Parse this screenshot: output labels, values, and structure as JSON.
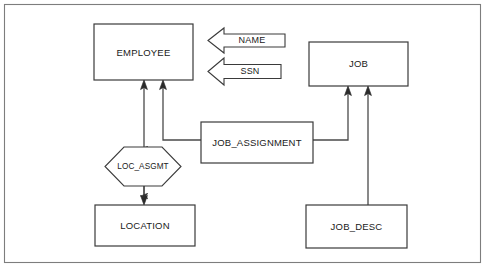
{
  "diagram": {
    "canvas": {
      "width": 487,
      "height": 272,
      "background": "#ffffff"
    },
    "frame": {
      "x": 4,
      "y": 4,
      "width": 477,
      "height": 259,
      "stroke": "#7d7d7d"
    },
    "stroke_color": "#3a3a3a",
    "line_color": "#4a4a4a",
    "fill_color": "#ffffff",
    "text_color": "#1a1a1a",
    "entities": [
      {
        "id": "employee",
        "label": "EMPLOYEE",
        "shape": "rectangle",
        "x": 94,
        "y": 24,
        "width": 99,
        "height": 56
      },
      {
        "id": "job",
        "label": "JOB",
        "shape": "rectangle",
        "x": 309,
        "y": 42,
        "width": 99,
        "height": 44
      },
      {
        "id": "job_assignment",
        "label": "JOB_ASSIGNMENT",
        "shape": "rectangle",
        "x": 201,
        "y": 122,
        "width": 112,
        "height": 41
      },
      {
        "id": "location",
        "label": "LOCATION",
        "shape": "rectangle",
        "x": 95,
        "y": 205,
        "width": 100,
        "height": 41
      },
      {
        "id": "job_desc",
        "label": "JOB_DESC",
        "shape": "rectangle",
        "x": 306,
        "y": 205,
        "width": 101,
        "height": 43
      }
    ],
    "relationships": [
      {
        "id": "loc_asgmt",
        "label": "LOC_ASGMT",
        "shape": "hexagon",
        "x": 105,
        "y": 147,
        "width": 76,
        "height": 39
      }
    ],
    "attributes": [
      {
        "id": "name",
        "label": "NAME",
        "shape": "left-arrow",
        "x": 208,
        "y": 28,
        "width": 77,
        "height": 25
      },
      {
        "id": "ssn",
        "label": "SSN",
        "shape": "left-arrow",
        "x": 208,
        "y": 58,
        "width": 73,
        "height": 27
      }
    ],
    "connections": [
      {
        "id": "locasgmt-employee",
        "from": "loc_asgmt",
        "to": "employee",
        "arrow": "to",
        "path": "M 144 147 L 144 82"
      },
      {
        "id": "locasgmt-location",
        "from": "loc_asgmt",
        "to": "location",
        "arrow": "to",
        "path": "M 144 186 L 144 203"
      },
      {
        "id": "jobassignment-employee",
        "from": "job_assignment",
        "to": "employee",
        "arrow": "to",
        "path": "M 201 140 L 163 140 L 163 82"
      },
      {
        "id": "jobassignment-job",
        "from": "job_assignment",
        "to": "job",
        "arrow": "to",
        "path": "M 313 140 L 348 140 L 348 88"
      },
      {
        "id": "jobdesc-job",
        "from": "job_desc",
        "to": "job",
        "arrow": "to",
        "path": "M 368 205 L 368 88"
      }
    ]
  }
}
